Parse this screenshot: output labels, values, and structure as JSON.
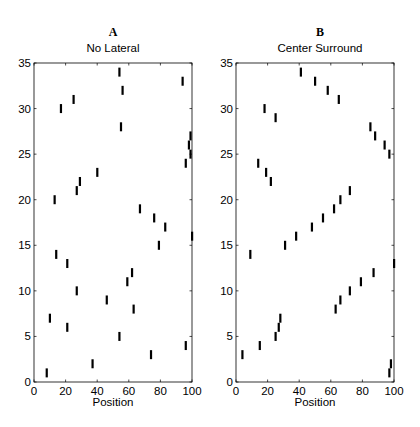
{
  "figure": {
    "panels": [
      {
        "letter": "A",
        "title": "No Lateral",
        "xlabel": "Position"
      },
      {
        "letter": "B",
        "title": "Center Surround",
        "xlabel": "Position"
      }
    ]
  },
  "chart_data": [
    {
      "type": "scatter",
      "panel": "A",
      "title": "No Lateral",
      "xlabel": "Position",
      "ylabel": "",
      "xlim": [
        0,
        100
      ],
      "ylim": [
        0,
        35
      ],
      "xticks": [
        0,
        20,
        40,
        60,
        80,
        100
      ],
      "yticks": [
        0,
        5,
        10,
        15,
        20,
        25,
        30,
        35
      ],
      "marker": "vertical-bar",
      "grid": false,
      "points": [
        [
          8,
          1
        ],
        [
          10,
          7
        ],
        [
          13,
          20
        ],
        [
          14,
          14
        ],
        [
          17,
          30
        ],
        [
          21,
          13
        ],
        [
          21,
          6
        ],
        [
          25,
          31
        ],
        [
          27,
          21
        ],
        [
          27,
          10
        ],
        [
          29,
          22
        ],
        [
          37,
          2
        ],
        [
          40,
          23
        ],
        [
          46,
          9
        ],
        [
          54,
          34
        ],
        [
          54,
          5
        ],
        [
          55,
          28
        ],
        [
          56,
          32
        ],
        [
          59,
          11
        ],
        [
          62,
          12
        ],
        [
          63,
          8
        ],
        [
          67,
          19
        ],
        [
          74,
          3
        ],
        [
          76,
          18
        ],
        [
          79,
          15
        ],
        [
          83,
          17
        ],
        [
          94,
          33
        ],
        [
          96,
          24
        ],
        [
          96,
          4
        ],
        [
          98,
          26
        ],
        [
          99,
          27
        ],
        [
          99,
          25
        ],
        [
          100,
          16
        ]
      ]
    },
    {
      "type": "scatter",
      "panel": "B",
      "title": "Center Surround",
      "xlabel": "Position",
      "ylabel": "",
      "xlim": [
        0,
        100
      ],
      "ylim": [
        0,
        35
      ],
      "xticks": [
        0,
        20,
        40,
        60,
        80,
        100
      ],
      "yticks": [
        0,
        5,
        10,
        15,
        20,
        25,
        30,
        35
      ],
      "marker": "vertical-bar",
      "grid": false,
      "points": [
        [
          4,
          3
        ],
        [
          9,
          14
        ],
        [
          14,
          24
        ],
        [
          15,
          4
        ],
        [
          18,
          30
        ],
        [
          19,
          23
        ],
        [
          22,
          22
        ],
        [
          25,
          5
        ],
        [
          25,
          29
        ],
        [
          27,
          6
        ],
        [
          28,
          7
        ],
        [
          31,
          15
        ],
        [
          38,
          16
        ],
        [
          41,
          34
        ],
        [
          48,
          17
        ],
        [
          50,
          33
        ],
        [
          55,
          18
        ],
        [
          58,
          32
        ],
        [
          62,
          19
        ],
        [
          63,
          8
        ],
        [
          65,
          31
        ],
        [
          66,
          20
        ],
        [
          66,
          9
        ],
        [
          72,
          10
        ],
        [
          72,
          21
        ],
        [
          79,
          11
        ],
        [
          85,
          28
        ],
        [
          87,
          12
        ],
        [
          88,
          27
        ],
        [
          94,
          26
        ],
        [
          97,
          25
        ],
        [
          97,
          1
        ],
        [
          98,
          2
        ],
        [
          100,
          13
        ]
      ]
    }
  ]
}
